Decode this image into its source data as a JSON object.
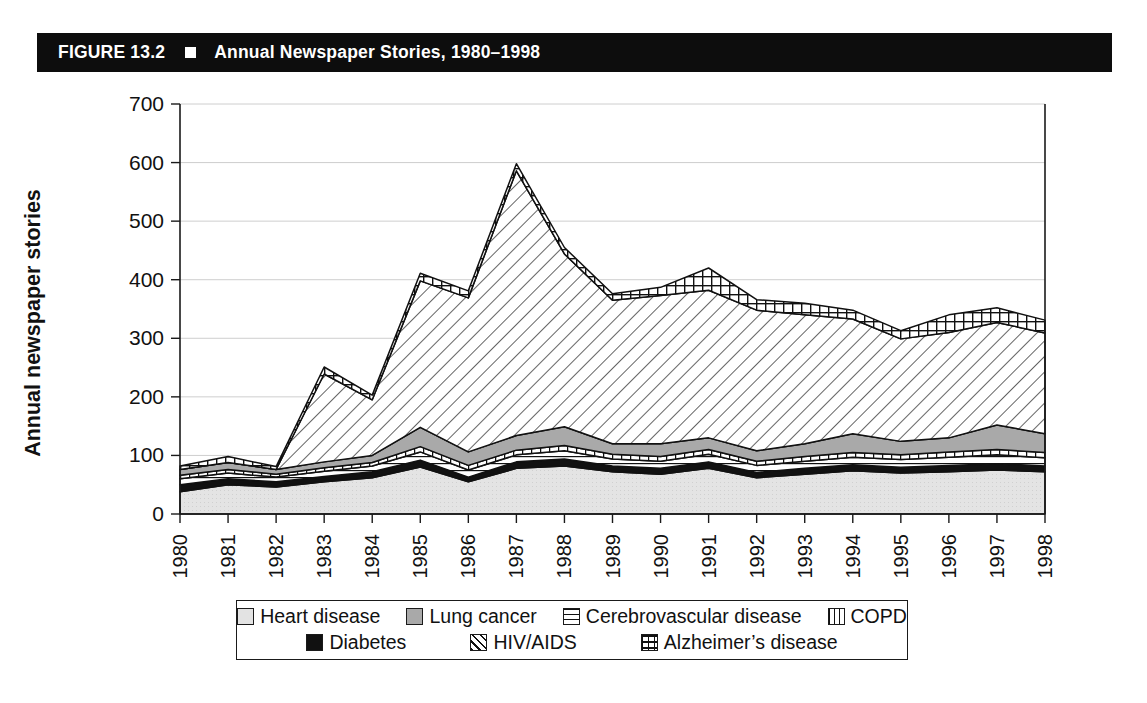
{
  "figure": {
    "number_label": "FIGURE 13.2",
    "title": "Annual Newspaper Stories, 1980–1998",
    "bullet_icon": "white-square-icon"
  },
  "axes": {
    "y_axis_title": "Annual newspaper stories",
    "y_ticks": [
      "0",
      "100",
      "200",
      "300",
      "400",
      "500",
      "600",
      "700"
    ],
    "x_ticks": [
      "1980",
      "1981",
      "1982",
      "1983",
      "1984",
      "1985",
      "1986",
      "1987",
      "1988",
      "1989",
      "1990",
      "1991",
      "1992",
      "1993",
      "1994",
      "1995",
      "1996",
      "1997",
      "1998"
    ]
  },
  "legend": {
    "rows": [
      [
        {
          "label": "Heart disease",
          "swatch": "light-gray-square-icon"
        },
        {
          "label": "Lung cancer",
          "swatch": "medium-gray-square-icon"
        },
        {
          "label": "Cerebrovascular disease",
          "swatch": "horizontal-lines-square-icon"
        },
        {
          "label": "COPD",
          "swatch": "vertical-lines-square-icon"
        }
      ],
      [
        {
          "label": "Diabetes",
          "swatch": "black-square-icon"
        },
        {
          "label": "HIV/AIDS",
          "swatch": "diagonal-hatch-square-icon"
        },
        {
          "label": "Alzheimer’s disease",
          "swatch": "checkered-square-icon"
        }
      ]
    ]
  },
  "colors": {
    "title_bar_background": "#0d0d0d",
    "title_text": "#ffffff",
    "heart_disease": "#e3e3e3",
    "lung_cancer": "#a9a9a9",
    "cerebrovascular": "#ffffff",
    "copd": "#ffffff",
    "diabetes": "#111111",
    "hiv_aids": "#ffffff",
    "alzheimers": "#ffffff",
    "outline": "#111111",
    "gridline": "#c8c8c8"
  },
  "chart_data": {
    "type": "area",
    "stacked": true,
    "title": "Annual Newspaper Stories, 1980–1998",
    "xlabel": "",
    "ylabel": "Annual newspaper stories",
    "ylim": [
      0,
      700
    ],
    "ytick_step": 100,
    "grid": true,
    "legend_position": "bottom",
    "categories": [
      "1980",
      "1981",
      "1982",
      "1983",
      "1984",
      "1985",
      "1986",
      "1987",
      "1988",
      "1989",
      "1990",
      "1991",
      "1992",
      "1993",
      "1994",
      "1995",
      "1996",
      "1997",
      "1998"
    ],
    "stack_order_bottom_to_top": [
      "Heart disease",
      "Diabetes",
      "Cerebrovascular disease",
      "COPD",
      "Lung cancer",
      "HIV/AIDS",
      "Alzheimer's disease"
    ],
    "series": [
      {
        "name": "Heart disease",
        "values": [
          38,
          50,
          46,
          55,
          62,
          80,
          55,
          78,
          82,
          72,
          68,
          78,
          62,
          68,
          74,
          70,
          72,
          75,
          72
        ]
      },
      {
        "name": "Diabetes",
        "values": [
          12,
          10,
          9,
          9,
          10,
          12,
          8,
          11,
          12,
          10,
          10,
          11,
          9,
          10,
          10,
          10,
          11,
          11,
          10
        ]
      },
      {
        "name": "Cerebrovascular disease",
        "values": [
          10,
          10,
          8,
          9,
          10,
          14,
          12,
          12,
          14,
          12,
          12,
          13,
          12,
          12,
          13,
          13,
          14,
          15,
          14
        ]
      },
      {
        "name": "COPD",
        "values": [
          6,
          6,
          5,
          6,
          6,
          9,
          8,
          8,
          9,
          8,
          8,
          8,
          7,
          8,
          8,
          8,
          9,
          9,
          9
        ]
      },
      {
        "name": "Lung cancer",
        "values": [
          10,
          12,
          8,
          10,
          12,
          33,
          23,
          25,
          32,
          18,
          22,
          20,
          18,
          22,
          32,
          23,
          24,
          42,
          32
        ]
      },
      {
        "name": "HIV/AIDS",
        "values": [
          0,
          0,
          0,
          150,
          95,
          250,
          263,
          452,
          295,
          245,
          253,
          252,
          240,
          220,
          196,
          175,
          180,
          175,
          172
        ]
      },
      {
        "name": "Alzheimer's disease",
        "values": [
          6,
          10,
          5,
          12,
          8,
          13,
          12,
          12,
          11,
          11,
          14,
          38,
          18,
          20,
          15,
          14,
          30,
          25,
          22
        ]
      }
    ],
    "totals": [
      82,
      98,
      81,
      251,
      203,
      411,
      381,
      598,
      455,
      376,
      387,
      420,
      366,
      360,
      348,
      313,
      340,
      352,
      331
    ],
    "annotations": [
      "HIV/AIDS coverage peaks in 1987",
      "Alzheimer's disease band widens after 1995"
    ]
  }
}
